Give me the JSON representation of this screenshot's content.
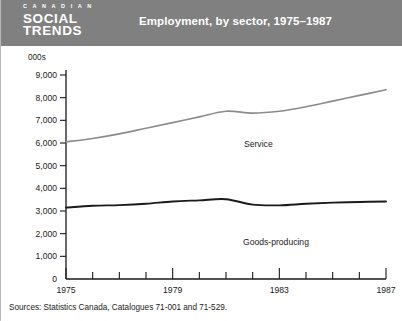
{
  "header": {
    "logo_line1": "C A N A D I A N",
    "logo_line2": "SOCIAL",
    "logo_line3": "TRENDS",
    "title": "Employment, by sector, 1975–1987",
    "background_color": "#808080",
    "text_color": "#ffffff"
  },
  "footer": {
    "source": "Sources: Statistics Canada, Catalogues 71-001 and 71-529."
  },
  "chart_data": {
    "type": "line",
    "title": "Employment, by sector, 1975–1987",
    "xlabel": "",
    "ylabel": "000s",
    "ylim": [
      0,
      9000
    ],
    "xlim": [
      1975,
      1987
    ],
    "grid": false,
    "legend": "inline-labels",
    "y_unit_label": "000s",
    "y_ticks": [
      0,
      1000,
      2000,
      3000,
      4000,
      5000,
      6000,
      7000,
      8000,
      9000
    ],
    "y_tick_labels": [
      "0",
      "1,000",
      "2,000",
      "3,000",
      "4,000",
      "5,000",
      "6,000",
      "7,000",
      "8,000",
      "9,000"
    ],
    "x": [
      1975,
      1976,
      1977,
      1978,
      1979,
      1980,
      1981,
      1982,
      1983,
      1984,
      1985,
      1986,
      1987
    ],
    "x_ticks": [
      1975,
      1976,
      1977,
      1978,
      1979,
      1980,
      1981,
      1982,
      1983,
      1984,
      1985,
      1986,
      1987
    ],
    "x_labeled_ticks": [
      1975,
      1979,
      1983,
      1987
    ],
    "x_tick_labels": [
      "1975",
      "1979",
      "1983",
      "1987"
    ],
    "series": [
      {
        "name": "Service",
        "label": "Service",
        "color": "#8c8c8c",
        "values": [
          6050,
          6200,
          6400,
          6650,
          6900,
          7150,
          7400,
          7320,
          7400,
          7600,
          7850,
          8100,
          8350
        ]
      },
      {
        "name": "Goods-producing",
        "label": "Goods-producing",
        "color": "#1a1a1a",
        "values": [
          3150,
          3230,
          3260,
          3320,
          3420,
          3470,
          3520,
          3280,
          3250,
          3320,
          3370,
          3400,
          3420
        ]
      }
    ]
  }
}
